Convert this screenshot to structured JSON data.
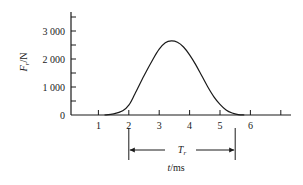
{
  "chart_data": {
    "type": "line",
    "title": "",
    "xlabel": "t/ms",
    "ylabel": "Fr/N",
    "xlabel_var": "t",
    "xlabel_unit": "/ms",
    "ylabel_var": "F",
    "ylabel_sub": "r",
    "ylabel_unit": "/N",
    "xlim": [
      0,
      7.4
    ],
    "ylim": [
      0,
      3600
    ],
    "grid": false,
    "legend": null,
    "x_ticks": [
      1,
      2,
      3,
      4,
      5,
      6,
      7
    ],
    "x_tick_labels": [
      "1",
      "2",
      "3",
      "4",
      "5",
      "6",
      ""
    ],
    "y_ticks": [
      0,
      1000,
      2000,
      3000
    ],
    "y_tick_labels": [
      "0",
      "1 000",
      "2 000",
      "3 000"
    ],
    "y_minor_ticks": [
      500,
      1500,
      2500,
      3500
    ],
    "series": [
      {
        "name": "Fr",
        "x": [
          1.2,
          1.5,
          1.8,
          2.0,
          2.2,
          2.5,
          2.8,
          3.0,
          3.2,
          3.4,
          3.6,
          3.8,
          4.0,
          4.2,
          4.4,
          4.6,
          4.8,
          5.0,
          5.2,
          5.4,
          5.6,
          5.8
        ],
        "y": [
          0,
          40,
          150,
          350,
          750,
          1400,
          2000,
          2350,
          2580,
          2650,
          2600,
          2430,
          2150,
          1800,
          1400,
          1000,
          650,
          380,
          180,
          70,
          15,
          0
        ]
      }
    ],
    "annotations": [
      {
        "type": "interval",
        "label_var": "T",
        "label_sub": "r",
        "label": "Tr",
        "x_start": 2.0,
        "x_end": 5.5
      }
    ]
  },
  "colors": {
    "line": "#1a1a1a",
    "background": "#ffffff"
  }
}
